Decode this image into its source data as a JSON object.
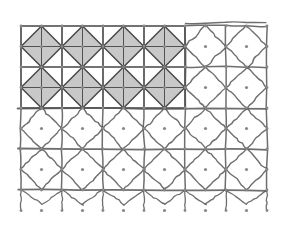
{
  "diagram": {
    "grid": {
      "origin_x": 21,
      "origin_y": 26,
      "cell_size": 41,
      "columns": 6,
      "rows": 4
    },
    "precise_region": {
      "columns": 4,
      "rows": 2,
      "fill": "#c8c8c8",
      "line_color": "#444444"
    },
    "sketch_region": {
      "line_color": "#555555",
      "description": "hand-drawn continuation of grid with diamonds (unshaded)"
    },
    "dot_color": "#888888",
    "background": "#ffffff"
  }
}
